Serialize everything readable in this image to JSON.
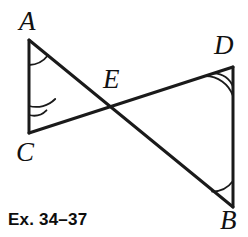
{
  "figure": {
    "type": "geometry-diagram",
    "width": 248,
    "height": 237,
    "stroke_color": "#1a1a1a",
    "background_color": "#ffffff",
    "stroke_width": 3,
    "arc_stroke_width": 1.8,
    "points": [
      {
        "name": "A",
        "label": "A",
        "x": 29,
        "y": 40,
        "label_x": 19,
        "label_y": 8,
        "marks": 1
      },
      {
        "name": "C",
        "label": "C",
        "x": 29,
        "y": 133,
        "label_x": 16,
        "label_y": 139,
        "marks": 2
      },
      {
        "name": "D",
        "label": "D",
        "x": 233,
        "y": 67,
        "label_x": 214,
        "label_y": 32,
        "marks": 2
      },
      {
        "name": "B",
        "label": "B",
        "x": 233,
        "y": 207,
        "label_x": 220,
        "label_y": 207,
        "marks": 1
      },
      {
        "name": "E",
        "label": "E",
        "x": 107,
        "y": 104,
        "label_x": 103,
        "label_y": 66,
        "marks": 0
      }
    ],
    "segments": [
      {
        "name": "AC",
        "from": "A",
        "to": "C"
      },
      {
        "name": "DB",
        "from": "D",
        "to": "B"
      },
      {
        "name": "AB",
        "from": "A",
        "to": "B"
      },
      {
        "name": "CD",
        "from": "C",
        "to": "D"
      }
    ],
    "angle_arcs": [
      {
        "at": "A",
        "count": 1,
        "radii": [
          25
        ]
      },
      {
        "at": "C",
        "count": 2,
        "radii": [
          18,
          27
        ]
      },
      {
        "at": "D",
        "count": 2,
        "radii": [
          20,
          29
        ]
      },
      {
        "at": "B",
        "count": 1,
        "radii": [
          26
        ]
      }
    ]
  },
  "caption": {
    "text": "Ex. 34–37",
    "x": 8,
    "y": 210
  }
}
